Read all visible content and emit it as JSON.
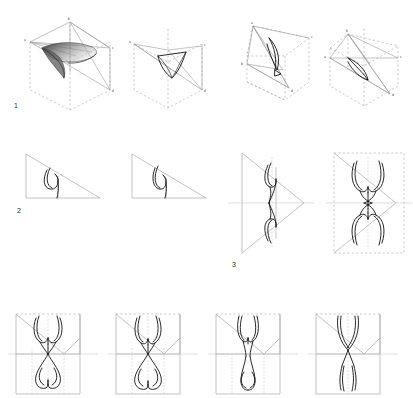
{
  "figure": {
    "background_color": "#ffffff",
    "width": 413,
    "height": 394,
    "stroke_colors": {
      "curve_dark": "#111111",
      "construction_light": "#9a9a9a",
      "dashed_hidden": "#a8a8a8",
      "shade_fill": "#6b6b6b"
    }
  },
  "row_labels": [
    {
      "text": "1",
      "x": 14,
      "y": 106
    },
    {
      "text": "2",
      "x": 17,
      "y": 211
    },
    {
      "text": "3",
      "x": 232,
      "y": 265
    }
  ],
  "rows": [
    {
      "id": "row-1",
      "number": "1",
      "description": "Four 3D cube-and-tetrahedron projections with a shaded curved surface patch",
      "panels": [
        {
          "id": "row1-panel-1",
          "name": "cube-tetrahedron-shaded",
          "vertex_labels": [
            "b",
            "a",
            "c",
            "d"
          ],
          "has_shaded_surface": true
        },
        {
          "id": "row1-panel-2",
          "name": "cube-tetrahedron-outline",
          "vertex_labels": [
            "a",
            "c",
            "d"
          ],
          "has_shaded_surface": false
        },
        {
          "id": "row1-panel-3",
          "name": "cube-tetrahedron-rotated-a",
          "vertex_labels": [
            "a",
            "c",
            "b",
            "d"
          ],
          "has_shaded_surface": false
        },
        {
          "id": "row1-panel-4",
          "name": "cube-tetrahedron-rotated-b",
          "vertex_labels": [
            "b",
            "a",
            "c",
            "d"
          ],
          "has_shaded_surface": false
        }
      ]
    },
    {
      "id": "row-2",
      "number": "2",
      "description": "Two right triangles each containing a hook-shaped curve",
      "panels": [
        {
          "id": "row2-panel-1",
          "name": "triangle-hook-curve-left"
        },
        {
          "id": "row2-panel-2",
          "name": "triangle-hook-curve-right"
        }
      ]
    },
    {
      "id": "row-3",
      "number": "3",
      "description": "Two panels: a half arrow-head figure and its mirrored double inside a dashed rectangle",
      "panels": [
        {
          "id": "row3-panel-1",
          "name": "half-arrowhead-figure"
        },
        {
          "id": "row3-panel-2",
          "name": "mirrored-arrowhead-figure"
        }
      ]
    },
    {
      "id": "row-4",
      "number": "",
      "description": "Four rectangular crease-pattern panels showing progressive symmetric curve variants",
      "panels": [
        {
          "id": "row4-panel-1",
          "name": "crease-pattern-variant-1"
        },
        {
          "id": "row4-panel-2",
          "name": "crease-pattern-variant-2"
        },
        {
          "id": "row4-panel-3",
          "name": "crease-pattern-variant-3"
        },
        {
          "id": "row4-panel-4",
          "name": "crease-pattern-variant-4"
        }
      ]
    }
  ]
}
